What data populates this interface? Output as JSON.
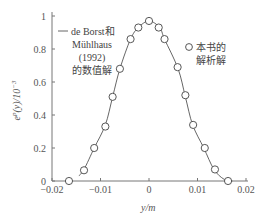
{
  "chart_data": {
    "type": "line",
    "title": "",
    "xlabel": "y/m",
    "ylabel": "e^p(y)/10^-3",
    "xlim": [
      -0.02,
      0.02
    ],
    "ylim": [
      0,
      1
    ],
    "grid": false,
    "xticks": [
      -0.02,
      -0.01,
      0,
      0.01,
      0.02
    ],
    "xtick_labels": [
      "−0.02",
      "−0.01",
      "0",
      "0.01",
      "0.02"
    ],
    "yticks": [
      0,
      0.2,
      0.4,
      0.6,
      0.8,
      1
    ],
    "ytick_labels": [
      "0",
      "0.2",
      "0.4",
      "0.6",
      "0.8",
      "1"
    ],
    "series": [
      {
        "name": "de Borst和 Mühlhaus (1992) 的数值解",
        "style": "line",
        "x": [
          -0.0145,
          -0.0134,
          -0.0113,
          -0.009,
          -0.0075,
          -0.006,
          -0.0038,
          -0.0022,
          0,
          0.0022,
          0.0032,
          0.006,
          0.0075,
          0.009,
          0.0113,
          0.0134,
          0.0155,
          0.0172
        ],
        "y": [
          0.03,
          0.07,
          0.2,
          0.34,
          0.51,
          0.68,
          0.86,
          0.93,
          0.97,
          0.93,
          0.86,
          0.68,
          0.51,
          0.34,
          0.2,
          0.07,
          0.01,
          0.0
        ]
      },
      {
        "name": "本书的解析解",
        "style": "circle",
        "x": [
          -0.0165,
          -0.0134,
          -0.0113,
          -0.009,
          -0.0075,
          -0.006,
          -0.0038,
          -0.0022,
          0,
          0.002,
          0.0032,
          0.0059,
          0.0075,
          0.0091,
          0.0115,
          0.0136,
          0.0163
        ],
        "y": [
          0.0,
          0.065,
          0.2,
          0.33,
          0.51,
          0.68,
          0.86,
          0.93,
          0.97,
          0.93,
          0.86,
          0.69,
          0.52,
          0.34,
          0.2,
          0.07,
          0.0
        ]
      }
    ],
    "legend": [
      {
        "marker": "line",
        "lines": [
          "de Borst和",
          "Mühlhaus",
          "(1992)",
          "的数值解"
        ],
        "placement": "top-left"
      },
      {
        "marker": "circle",
        "lines": [
          "本书的",
          "解析解"
        ],
        "placement": "top-right"
      }
    ]
  }
}
